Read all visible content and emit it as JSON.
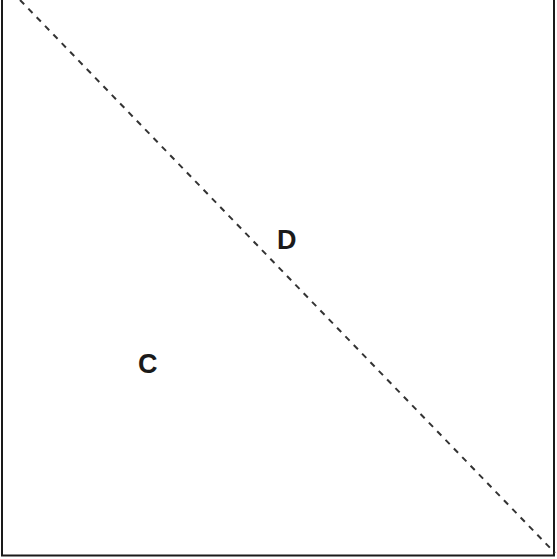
{
  "diagram": {
    "regions": [
      {
        "id": "C",
        "label": "C",
        "x": 138,
        "y": 351
      },
      {
        "id": "D",
        "label": "D",
        "x": 277,
        "y": 227
      }
    ],
    "boundary": {
      "style": "solid",
      "color": "#1a1a1a"
    },
    "diagonal": {
      "style": "dashed",
      "color": "#333333",
      "from": [
        20,
        0
      ],
      "to": [
        555,
        555
      ]
    }
  }
}
